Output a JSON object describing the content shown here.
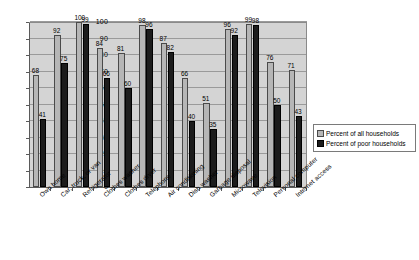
{
  "chart_data": {
    "type": "bar",
    "title": "",
    "xlabel": "",
    "ylabel": "",
    "ylim": [
      0,
      100
    ],
    "ytick_step": 10,
    "yticks": [
      0,
      10,
      20,
      30,
      40,
      50,
      60,
      70,
      80,
      90,
      100
    ],
    "grid": true,
    "legend_position": "right",
    "categories": [
      "Own home",
      "Car, truck, or van",
      "Refrigerator",
      "Clothes washer",
      "Clothes dryer",
      "Telephone",
      "Air conditioning",
      "Dish washer",
      "Garbage disposal",
      "Microwave",
      "Television",
      "Personal computer",
      "Internet access"
    ],
    "series": [
      {
        "name": "Percent of all households",
        "color": "#b6b6b6",
        "values": [
          68,
          92,
          100,
          84,
          81,
          98,
          87,
          66,
          51,
          96,
          99,
          76,
          71
        ]
      },
      {
        "name": "Percent of poor households",
        "color": "#1c1c1c",
        "values": [
          41,
          75,
          99,
          66,
          60,
          96,
          82,
          40,
          35,
          92,
          98,
          50,
          43
        ]
      }
    ]
  },
  "legend": {
    "items": [
      {
        "label": "Percent of all households"
      },
      {
        "label": "Percent of poor households"
      }
    ]
  }
}
